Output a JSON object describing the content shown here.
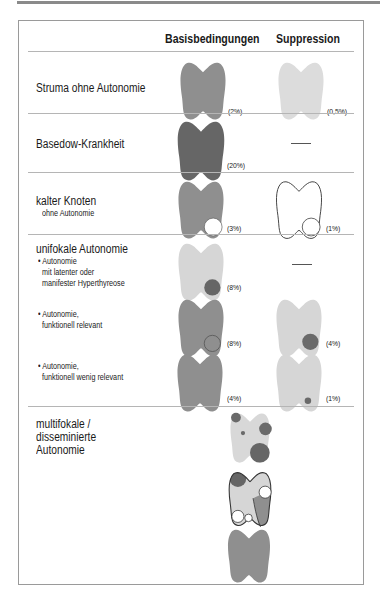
{
  "colors": {
    "medium_gray": "#8f8f8f",
    "dark_gray": "#6a6a6a",
    "light_gray": "#d4d4d4",
    "node_dark": "#6b6b6b",
    "outline": "#444444"
  },
  "header": {
    "col_basis": "Basisbedingungen",
    "col_suppression": "Suppression"
  },
  "rows": {
    "struma": {
      "label": "Struma ohne Autonomie",
      "basis_pct": "(2%)",
      "supp_pct": "(0,5%)"
    },
    "basedow": {
      "label": "Basedow-Krankheit",
      "basis_pct": "(20%)",
      "supp_value": "—"
    },
    "kalter": {
      "label": "kalter Knoten",
      "sublabel": "ohne Autonomie",
      "basis_pct": "(3%)",
      "supp_pct": "(1%)"
    },
    "unifokal": {
      "label": "unifokale Autonomie",
      "items": [
        {
          "bullet": "•",
          "lines": [
            "Autonomie",
            "mit latenter oder",
            "manifester Hyperthyreose"
          ],
          "basis_pct": "(8%)",
          "supp_value": "—"
        },
        {
          "bullet": "•",
          "lines": [
            "Autonomie,",
            "funktionell relevant"
          ],
          "basis_pct": "(8%)",
          "supp_pct": "(4%)"
        },
        {
          "bullet": "•",
          "lines": [
            "Autonomie,",
            "funktionell wenig relevant"
          ],
          "basis_pct": "(4%)",
          "supp_pct": "(1%)"
        }
      ]
    },
    "multifokal": {
      "lines": [
        "multifokale /",
        "disseminierte",
        "Autonomie"
      ]
    }
  }
}
